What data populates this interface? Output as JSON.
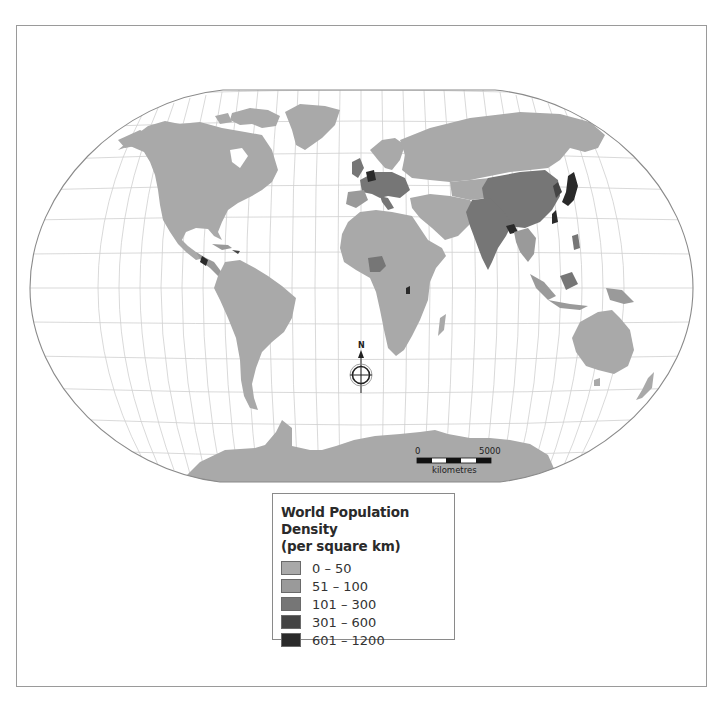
{
  "map": {
    "title": "World Population Density",
    "projection": "Winkel Tripel (rounded world projection)",
    "colors": {
      "ocean": "#ffffff",
      "graticule": "#c8c8c8",
      "outline": "#8a8a8a",
      "frame": "#9a9a9a"
    },
    "north_arrow": {
      "label": "N"
    },
    "scale_bar": {
      "start_label": "0",
      "end_label": "5000",
      "unit_label": "kilometres"
    }
  },
  "legend": {
    "title_line1": "World Population Density",
    "title_line2": "(per square km)",
    "items": [
      {
        "label": "0 – 50",
        "color": "#a9a9a9"
      },
      {
        "label": "51 – 100",
        "color": "#9a9a9a"
      },
      {
        "label": "101 – 300",
        "color": "#767676"
      },
      {
        "label": "301 – 600",
        "color": "#444444"
      },
      {
        "label": "601 – 1200",
        "color": "#2a2a2a"
      }
    ]
  }
}
